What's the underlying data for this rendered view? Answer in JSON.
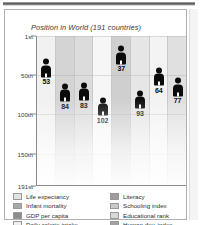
{
  "panel": {
    "scrollbar": "vertical-scrollbar"
  },
  "chart_data": {
    "type": "bar",
    "title": "Position in World (191 countries)",
    "xlabel": "",
    "ylabel": "",
    "ylim": [
      1,
      191
    ],
    "y_inverted": true,
    "grid": true,
    "legend_position": "bottom",
    "tick_labels": [
      "1st",
      "50th",
      "100th",
      "150th",
      "191st"
    ],
    "tick_values": [
      1,
      50,
      100,
      150,
      191
    ],
    "categories": [
      "Life expectancy",
      "Infant mortality",
      "GDP per capita",
      "Daily calorie intake",
      "Literacy",
      "Schooling index",
      "Educational rank",
      "Human dev. index"
    ],
    "values": [
      53,
      84,
      83,
      102,
      37,
      93,
      64,
      77
    ],
    "marker": "person-icon",
    "column_shades": [
      "#f1f1f1",
      "#d4d4d4",
      "#dcdcdc",
      "#f6f6f6",
      "#cfcfcf",
      "#e6e6e6",
      "#f3f3f3",
      "#e0e0e0"
    ]
  },
  "legend": {
    "left": [
      {
        "label": "Life expectancy",
        "color": "#e2e2e2"
      },
      {
        "label": "Infant mortality",
        "color": "#a8a8a8"
      },
      {
        "label": "GDP per capita",
        "color": "#8c8c8c"
      },
      {
        "label": "Daily calorie intake",
        "color": "#efefef"
      }
    ],
    "right": [
      {
        "label": "Literacy",
        "color": "#9d9d9d"
      },
      {
        "label": "Schooling index",
        "color": "#c9c9c9"
      },
      {
        "label": "Educational rank",
        "color": "#d8d8d8"
      },
      {
        "label": "Human dev. index",
        "color": "#a2a2a2"
      }
    ]
  }
}
